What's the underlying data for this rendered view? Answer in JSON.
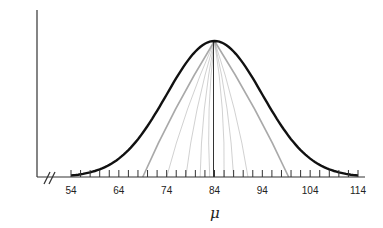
{
  "chart_data": {
    "type": "line",
    "title": "",
    "xlabel": "μ",
    "ylabel": "",
    "xlim": [
      54,
      114
    ],
    "x_ticks": [
      54,
      64,
      74,
      84,
      94,
      104,
      114
    ],
    "minor_tick_step": 2,
    "axis_break": true,
    "grid": false,
    "series": [
      {
        "name": "normal-curve",
        "kind": "bell",
        "mean": 84,
        "sd": 10,
        "color": "#111111",
        "x": [
          54,
          59,
          64,
          69,
          74,
          79,
          84,
          89,
          94,
          99,
          104,
          109,
          114
        ],
        "values": [
          0.011,
          0.044,
          0.135,
          0.325,
          0.607,
          0.882,
          1.0,
          0.882,
          0.607,
          0.325,
          0.135,
          0.044,
          0.011
        ]
      }
    ],
    "lines_from_peak": {
      "color": "#9a9a9a",
      "peak": 84,
      "ends": [
        69,
        74,
        78,
        81,
        83,
        86,
        88,
        91,
        99.5
      ]
    },
    "center_line": {
      "x": 84,
      "color": "#333333"
    }
  },
  "labels": {
    "xlabel": "μ",
    "ticks": [
      "54",
      "64",
      "74",
      "84",
      "94",
      "104",
      "114"
    ]
  }
}
